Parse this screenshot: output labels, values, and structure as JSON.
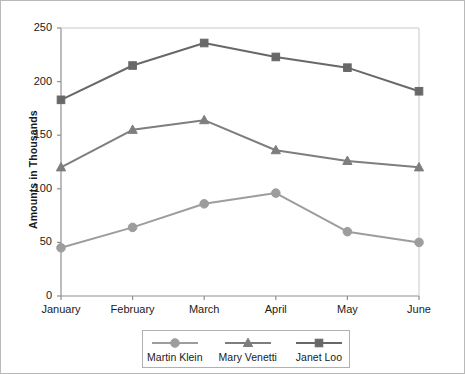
{
  "chart_data": {
    "type": "line",
    "title": "",
    "subtitle": "",
    "xlabel": "",
    "ylabel": "Amounts in Thousands",
    "categories": [
      "January",
      "February",
      "March",
      "April",
      "May",
      "June"
    ],
    "ylim": [
      0,
      250
    ],
    "yticks": [
      0,
      50,
      100,
      150,
      200,
      250
    ],
    "ytick_labels": [
      "0",
      "50",
      "100",
      "150",
      "200",
      "250"
    ],
    "grid": false,
    "legend_position": "bottom",
    "series": [
      {
        "name": "Martin Klein",
        "marker": "circle",
        "color": "#9d9d9d",
        "values": [
          45,
          64,
          86,
          96,
          60,
          50
        ]
      },
      {
        "name": "Mary Venetti",
        "marker": "triangle",
        "color": "#7e7e7e",
        "values": [
          120,
          155,
          164,
          136,
          126,
          120
        ]
      },
      {
        "name": "Janet Loo",
        "marker": "square",
        "color": "#686868",
        "values": [
          183,
          215,
          236,
          223,
          213,
          191
        ]
      }
    ]
  },
  "figure": {
    "border_color": "#b9b9b9",
    "background": "#ffffff",
    "axis_color": "#8f8f8f",
    "text_color": "#1a1a1a"
  }
}
